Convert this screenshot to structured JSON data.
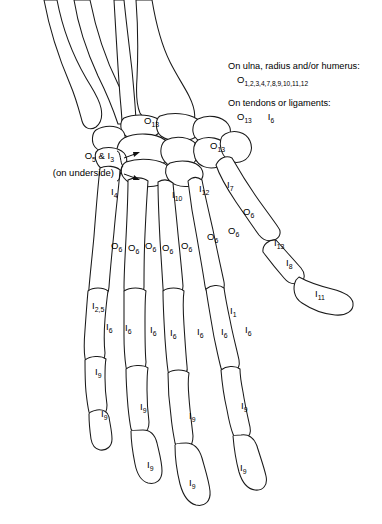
{
  "figure": {
    "type": "anatomical-diagram",
    "background": "#ffffff",
    "line_color": "#1a1a1a"
  },
  "legend": {
    "entries": [
      {
        "heading": "On ulna, radius and/or humerus:",
        "codes": [
          {
            "letter": "O",
            "subscript": "1,2,3,4,7,8,9,10,11,12"
          }
        ]
      },
      {
        "heading": "On tendons or ligaments:",
        "codes": [
          {
            "letter": "O",
            "subscript": "13"
          },
          {
            "letter": "I",
            "subscript": "6"
          }
        ]
      }
    ]
  },
  "left_note": {
    "line1_letter_a": "O",
    "line1_sub_a": "5",
    "line1_amp": " & ",
    "line1_letter_b": "I",
    "line1_sub_b": "3",
    "line2": "(on underside)",
    "marker": "brace-with-two-arrows"
  },
  "bone_labels": [
    {
      "id": "o13-capitate",
      "letter": "O",
      "sub": "13",
      "x": 144,
      "y": 116
    },
    {
      "id": "o13-hamate",
      "letter": "O",
      "sub": "13",
      "x": 210,
      "y": 141
    },
    {
      "id": "i4-mc5",
      "letter": "I",
      "sub": "4",
      "x": 111,
      "y": 187
    },
    {
      "id": "i10-mc3",
      "letter": "I",
      "sub": "10",
      "x": 172,
      "y": 190
    },
    {
      "id": "i12-mc2",
      "letter": "I",
      "sub": "12",
      "x": 199,
      "y": 184
    },
    {
      "id": "i7-mc1",
      "letter": "I",
      "sub": "7",
      "x": 227,
      "y": 180
    },
    {
      "id": "o6-thumb-prox",
      "letter": "O",
      "sub": "6",
      "x": 243,
      "y": 207
    },
    {
      "id": "o6-mc2-head",
      "letter": "O",
      "sub": "6",
      "x": 228,
      "y": 226
    },
    {
      "id": "o6-mc3-head",
      "letter": "O",
      "sub": "6",
      "x": 207,
      "y": 232
    },
    {
      "id": "o6-a",
      "letter": "O",
      "sub": "6",
      "x": 111,
      "y": 241
    },
    {
      "id": "o6-b",
      "letter": "O",
      "sub": "6",
      "x": 128,
      "y": 243
    },
    {
      "id": "o6-c",
      "letter": "O",
      "sub": "6",
      "x": 145,
      "y": 241
    },
    {
      "id": "o6-d",
      "letter": "O",
      "sub": "6",
      "x": 162,
      "y": 243
    },
    {
      "id": "o6-e",
      "letter": "O",
      "sub": "6",
      "x": 181,
      "y": 241
    },
    {
      "id": "i13-thumb",
      "letter": "I",
      "sub": "13",
      "x": 274,
      "y": 238
    },
    {
      "id": "i8-thumb",
      "letter": "I",
      "sub": "8",
      "x": 286,
      "y": 258
    },
    {
      "id": "i11-thumb-tip",
      "letter": "I",
      "sub": "11",
      "x": 315,
      "y": 289
    },
    {
      "id": "i25-pinky",
      "letter": "I",
      "sub": "2,5",
      "x": 92,
      "y": 301
    },
    {
      "id": "i1-index",
      "letter": "I",
      "sub": "1",
      "x": 230,
      "y": 306
    },
    {
      "id": "i6-a",
      "letter": "I",
      "sub": "6",
      "x": 106,
      "y": 322
    },
    {
      "id": "i6-b",
      "letter": "I",
      "sub": "6",
      "x": 125,
      "y": 323
    },
    {
      "id": "i6-c",
      "letter": "I",
      "sub": "6",
      "x": 150,
      "y": 325
    },
    {
      "id": "i6-d",
      "letter": "I",
      "sub": "6",
      "x": 170,
      "y": 328
    },
    {
      "id": "i6-e",
      "letter": "I",
      "sub": "6",
      "x": 197,
      "y": 327
    },
    {
      "id": "i6-f",
      "letter": "I",
      "sub": "6",
      "x": 221,
      "y": 327
    },
    {
      "id": "i6-g",
      "letter": "I",
      "sub": "6",
      "x": 245,
      "y": 325
    },
    {
      "id": "i9-a",
      "letter": "I",
      "sub": "9",
      "x": 95,
      "y": 367
    },
    {
      "id": "i9-b",
      "letter": "I",
      "sub": "9",
      "x": 101,
      "y": 409
    },
    {
      "id": "i9-c",
      "letter": "I",
      "sub": "9",
      "x": 140,
      "y": 402
    },
    {
      "id": "i9-d",
      "letter": "I",
      "sub": "9",
      "x": 189,
      "y": 411
    },
    {
      "id": "i9-e",
      "letter": "I",
      "sub": "9",
      "x": 241,
      "y": 401
    },
    {
      "id": "i9-f",
      "letter": "I",
      "sub": "9",
      "x": 147,
      "y": 460
    },
    {
      "id": "i9-g",
      "letter": "I",
      "sub": "9",
      "x": 189,
      "y": 478
    },
    {
      "id": "i9-h",
      "letter": "I",
      "sub": "9",
      "x": 240,
      "y": 463
    }
  ]
}
